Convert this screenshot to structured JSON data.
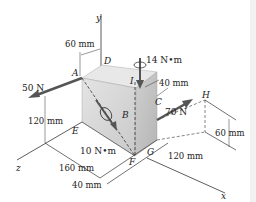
{
  "figure": {
    "axes": {
      "x": "x",
      "y": "y",
      "z": "z"
    },
    "points": {
      "A": "A",
      "B": "B",
      "C": "C",
      "D": "D",
      "E": "E",
      "F": "F",
      "G": "G",
      "H": "H",
      "I": "I"
    },
    "forces": {
      "f50": "50 N",
      "f70": "70 N"
    },
    "moments": {
      "m14": "14 N•m",
      "m10": "10 N•m"
    },
    "dimensions": {
      "d60_top": "60 mm",
      "d40_top": "40 mm",
      "d120_left": "120 mm",
      "d160": "160 mm",
      "d40_bottom": "40 mm",
      "d60_right": "60 mm",
      "d120_right": "120 mm"
    },
    "colors": {
      "box_front": "#d9d9d9",
      "box_side": "#c4c4c4",
      "box_top": "#e6e6e6",
      "arrow": "#555555",
      "line": "#333333"
    }
  }
}
